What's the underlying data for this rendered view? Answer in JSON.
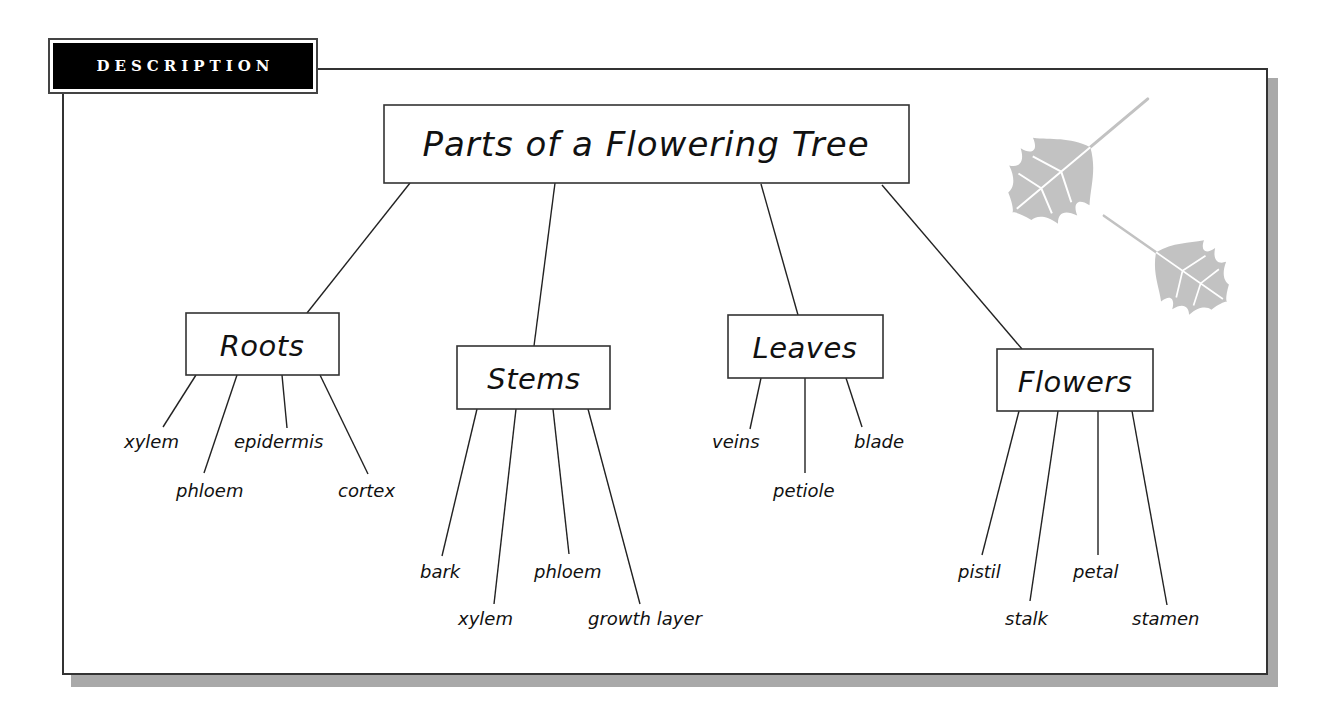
{
  "header": {
    "tab_label": "DESCRIPTION"
  },
  "diagram": {
    "title": "Parts of a Flowering Tree",
    "branches": [
      {
        "label": "Roots",
        "parts": [
          "xylem",
          "phloem",
          "epidermis",
          "cortex"
        ]
      },
      {
        "label": "Stems",
        "parts": [
          "bark",
          "xylem",
          "phloem",
          "growth layer"
        ]
      },
      {
        "label": "Leaves",
        "parts": [
          "veins",
          "petiole",
          "blade"
        ]
      },
      {
        "label": "Flowers",
        "parts": [
          "pistil",
          "stalk",
          "petal",
          "stamen"
        ]
      }
    ]
  },
  "decorations": {
    "icons": [
      "leaf-icon",
      "leaf-icon"
    ],
    "leaf_color": "#c2c2c2"
  },
  "colors": {
    "frame_border": "#333333",
    "frame_shadow": "#a9a9a9",
    "tab_background": "#000000",
    "tab_text": "#ffffff",
    "line": "#222222"
  }
}
